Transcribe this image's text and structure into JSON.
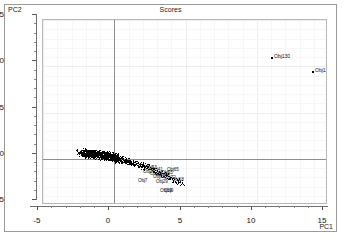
{
  "chart_data": {
    "type": "scatter",
    "title": "Scores",
    "xlabel": "PC1",
    "ylabel": "PC2",
    "xlim": [
      -5,
      15
    ],
    "ylim": [
      -5,
      15
    ],
    "xticks": [
      -5,
      0,
      5,
      10,
      15
    ],
    "yticks": [
      15,
      10,
      5,
      0,
      -5
    ],
    "xtick_labels": [
      "-5",
      "0",
      "5",
      "10",
      "15"
    ],
    "ytick_labels": [
      "15",
      "10",
      "5",
      "0",
      "-5"
    ],
    "grid": true,
    "legend": "none",
    "zero_lines": true,
    "point_labels_shown": true,
    "annotations": [
      {
        "label": "Obj130",
        "x": 11.0,
        "y": 11.0
      },
      {
        "label": "Obj129",
        "x": 13.9,
        "y": 9.5
      }
    ],
    "cluster_note": "dense elongated cluster from (-2.4, 0.8) to (4.8, -3.5) trending down-right",
    "labeled_cluster_points": [
      {
        "label": "Obj53",
        "x": 2.05,
        "y": -1.05
      },
      {
        "label": "Obj41",
        "x": 2.45,
        "y": -1.2
      },
      {
        "label": "Obj65",
        "x": 3.55,
        "y": -1.25
      },
      {
        "label": "Obj27",
        "x": 1.85,
        "y": -1.45
      },
      {
        "label": "Obj55",
        "x": 3.15,
        "y": -1.5
      },
      {
        "label": "Obj38",
        "x": 2.35,
        "y": -1.7
      },
      {
        "label": "Obj44",
        "x": 2.95,
        "y": -1.8
      },
      {
        "label": "Obj61",
        "x": 2.55,
        "y": -2.0
      },
      {
        "label": "Obj72",
        "x": 3.35,
        "y": -2.05
      },
      {
        "label": "Obj18",
        "x": 3.9,
        "y": -2.35
      },
      {
        "label": "Obj7",
        "x": 1.55,
        "y": -2.45
      },
      {
        "label": "Obj29",
        "x": 2.8,
        "y": -2.5
      },
      {
        "label": "Obj19",
        "x": 3.05,
        "y": -3.45
      },
      {
        "label": "Obj9",
        "x": 3.35,
        "y": -3.5
      }
    ],
    "series": [
      {
        "name": "Scores",
        "points": [
          [
            -2.4,
            0.75
          ],
          [
            -2.3,
            0.6
          ],
          [
            -2.2,
            0.7
          ],
          [
            -2.1,
            0.55
          ],
          [
            -2.05,
            0.85
          ],
          [
            -2.0,
            0.4
          ],
          [
            -1.95,
            0.65
          ],
          [
            -1.9,
            0.5
          ],
          [
            -1.85,
            0.8
          ],
          [
            -1.8,
            0.35
          ],
          [
            -1.75,
            0.6
          ],
          [
            -1.7,
            0.72
          ],
          [
            -1.65,
            0.45
          ],
          [
            -1.6,
            0.58
          ],
          [
            -1.55,
            0.3
          ],
          [
            -1.5,
            0.66
          ],
          [
            -1.45,
            0.48
          ],
          [
            -1.4,
            0.75
          ],
          [
            -1.35,
            0.25
          ],
          [
            -1.3,
            0.55
          ],
          [
            -1.25,
            0.62
          ],
          [
            -1.2,
            0.38
          ],
          [
            -1.15,
            0.7
          ],
          [
            -1.1,
            0.2
          ],
          [
            -1.05,
            0.5
          ],
          [
            -1.0,
            0.6
          ],
          [
            -0.95,
            0.3
          ],
          [
            -0.9,
            0.45
          ],
          [
            -0.85,
            0.68
          ],
          [
            -0.8,
            0.15
          ],
          [
            -0.75,
            0.52
          ],
          [
            -0.7,
            0.35
          ],
          [
            -0.65,
            0.58
          ],
          [
            -0.6,
            0.22
          ],
          [
            -0.55,
            0.44
          ],
          [
            -0.5,
            0.62
          ],
          [
            -0.45,
            0.1
          ],
          [
            -0.4,
            0.4
          ],
          [
            -0.35,
            0.28
          ],
          [
            -0.3,
            0.5
          ],
          [
            -0.25,
            0.18
          ],
          [
            -0.2,
            0.36
          ],
          [
            -0.15,
            0.05
          ],
          [
            -0.1,
            0.3
          ],
          [
            -0.05,
            0.42
          ],
          [
            0.0,
            0.12
          ],
          [
            0.05,
            0.25
          ],
          [
            0.1,
            0.0
          ],
          [
            0.15,
            0.2
          ],
          [
            0.2,
            -0.08
          ],
          [
            0.25,
            0.15
          ],
          [
            0.3,
            -0.15
          ],
          [
            0.4,
            0.05
          ],
          [
            0.5,
            -0.2
          ],
          [
            0.6,
            -0.05
          ],
          [
            0.7,
            -0.3
          ],
          [
            0.8,
            -0.12
          ],
          [
            0.9,
            -0.38
          ],
          [
            1.0,
            -0.22
          ],
          [
            1.1,
            -0.45
          ],
          [
            1.2,
            -0.3
          ],
          [
            1.3,
            -0.55
          ],
          [
            1.4,
            -0.4
          ],
          [
            1.5,
            -0.62
          ],
          [
            1.6,
            -0.48
          ],
          [
            1.7,
            -0.7
          ],
          [
            1.8,
            -0.55
          ],
          [
            1.9,
            -0.8
          ],
          [
            2.0,
            -0.65
          ],
          [
            2.1,
            -0.9
          ],
          [
            2.2,
            -0.75
          ],
          [
            2.3,
            -1.0
          ],
          [
            2.4,
            -0.85
          ],
          [
            2.5,
            -1.15
          ],
          [
            2.6,
            -1.0
          ],
          [
            2.7,
            -1.3
          ],
          [
            2.8,
            -1.1
          ],
          [
            2.9,
            -1.45
          ],
          [
            3.0,
            -1.25
          ],
          [
            3.1,
            -1.6
          ],
          [
            3.2,
            -1.4
          ],
          [
            3.3,
            -1.75
          ],
          [
            3.4,
            -1.55
          ],
          [
            3.5,
            -1.9
          ],
          [
            3.6,
            -1.7
          ],
          [
            3.7,
            -2.05
          ],
          [
            3.8,
            -1.85
          ],
          [
            3.9,
            -2.2
          ],
          [
            4.0,
            -2.0
          ],
          [
            4.1,
            -2.35
          ],
          [
            4.2,
            -2.15
          ],
          [
            4.3,
            -2.5
          ],
          [
            4.4,
            -2.3
          ],
          [
            4.5,
            -2.6
          ],
          [
            4.6,
            -2.45
          ],
          [
            4.7,
            -2.7
          ],
          [
            11.0,
            11.0
          ],
          [
            13.9,
            9.5
          ]
        ]
      }
    ]
  }
}
